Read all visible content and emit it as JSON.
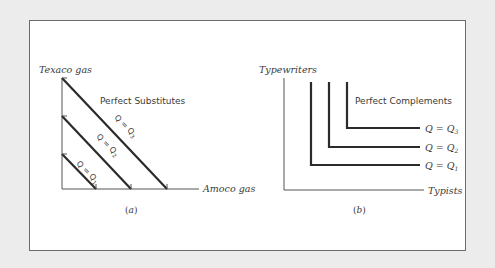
{
  "colors": {
    "page_background": "#ececec",
    "frame_background": "#ffffff",
    "frame_border": "#6b6b6b",
    "axis": "#555555",
    "curve": "#2b2b2b",
    "text": "#3a3a3a"
  },
  "panel_a": {
    "label": "a",
    "y_axis_label": "Texaco gas",
    "x_axis_label": "Amoco gas",
    "caption": "Perfect Substitutes",
    "curves": [
      {
        "label": "Q = Q",
        "subscript": "1",
        "start": [
          62,
          154
        ],
        "end": [
          96,
          189
        ]
      },
      {
        "label": "Q = Q",
        "subscript": "2",
        "start": [
          62,
          116
        ],
        "end": [
          131,
          189
        ]
      },
      {
        "label": "Q = Q",
        "subscript": "3",
        "start": [
          62,
          78
        ],
        "end": [
          167,
          189
        ]
      }
    ]
  },
  "panel_b": {
    "label": "b",
    "y_axis_label": "Typewriters",
    "x_axis_label": "Typists",
    "caption": "Perfect Complements",
    "curves": [
      {
        "label": "Q = Q",
        "subscript": "1",
        "corner": [
          311,
          165
        ],
        "top_y": 82,
        "right_x": 420
      },
      {
        "label": "Q = Q",
        "subscript": "2",
        "corner": [
          329,
          147
        ],
        "top_y": 82,
        "right_x": 420
      },
      {
        "label": "Q = Q",
        "subscript": "3",
        "corner": [
          347,
          128
        ],
        "top_y": 82,
        "right_x": 420
      }
    ]
  },
  "chart_data": [
    {
      "type": "line",
      "title": "Perfect Substitutes",
      "xlabel": "Amoco gas",
      "ylabel": "Texaco gas",
      "panel": "(a)",
      "series": [
        {
          "name": "Q = Q1",
          "x": [
            0,
            1
          ],
          "y": [
            1,
            0
          ]
        },
        {
          "name": "Q = Q2",
          "x": [
            0,
            2
          ],
          "y": [
            2,
            0
          ]
        },
        {
          "name": "Q = Q3",
          "x": [
            0,
            3
          ],
          "y": [
            3,
            0
          ]
        }
      ],
      "grid": false
    },
    {
      "type": "line",
      "title": "Perfect Complements",
      "xlabel": "Typists",
      "ylabel": "Typewriters",
      "panel": "(b)",
      "series": [
        {
          "name": "Q = Q1",
          "x": [
            1,
            1,
            4
          ],
          "y": [
            4,
            1,
            1
          ]
        },
        {
          "name": "Q = Q2",
          "x": [
            2,
            2,
            4
          ],
          "y": [
            4,
            2,
            2
          ]
        },
        {
          "name": "Q = Q3",
          "x": [
            3,
            3,
            4
          ],
          "y": [
            4,
            3,
            3
          ]
        }
      ],
      "grid": false
    }
  ]
}
